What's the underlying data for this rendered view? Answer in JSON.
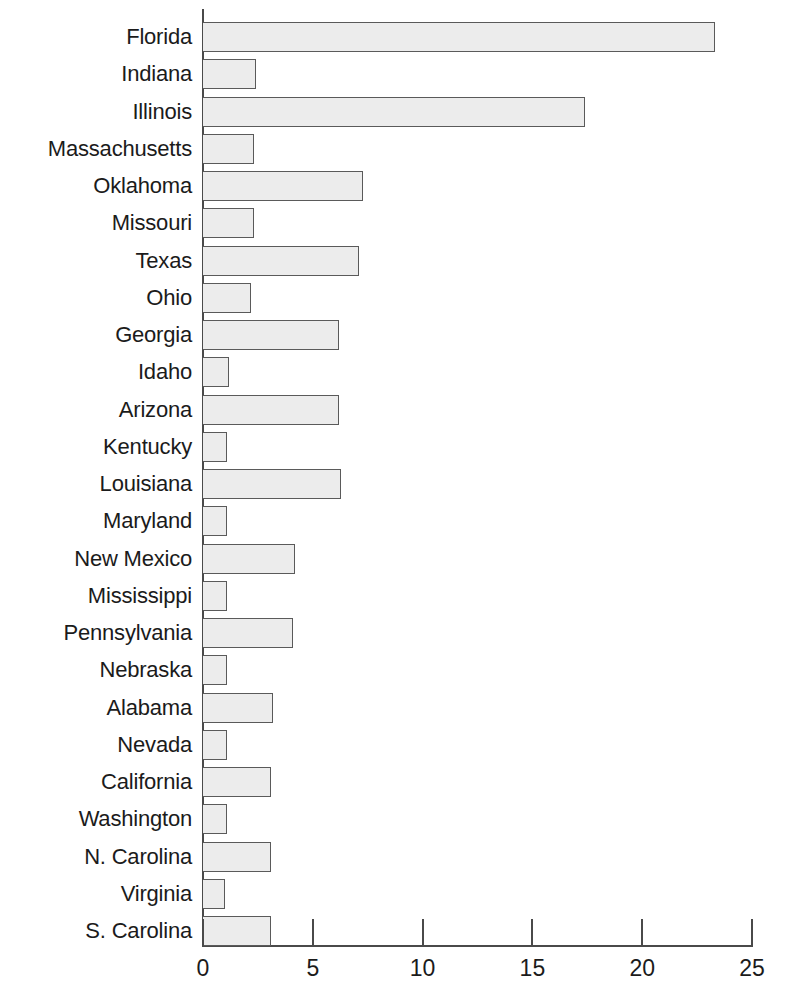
{
  "chart_data": {
    "type": "bar",
    "orientation": "horizontal",
    "title": "",
    "subtitle": "",
    "xlabel": "",
    "ylabel": "",
    "xlim": [
      0,
      25
    ],
    "grid": false,
    "legend": null,
    "xticks": [
      0,
      5,
      10,
      15,
      20,
      25
    ],
    "xtick_labels": [
      "0",
      "5",
      "10",
      "15",
      "20",
      "25"
    ],
    "categories": [
      "Florida",
      "Indiana",
      "Illinois",
      "Massachusetts",
      "Oklahoma",
      "Missouri",
      "Texas",
      "Ohio",
      "Georgia",
      "Idaho",
      "Arizona",
      "Kentucky",
      "Louisiana",
      "Maryland",
      "New Mexico",
      "Mississippi",
      "Pennsylvania",
      "Nebraska",
      "Alabama",
      "Nevada",
      "California",
      "Washington",
      "N. Carolina",
      "Virginia",
      "S. Carolina"
    ],
    "values": [
      23.3,
      2.4,
      17.4,
      2.3,
      7.3,
      2.3,
      7.1,
      2.2,
      6.2,
      1.2,
      6.2,
      1.1,
      6.3,
      1.1,
      4.2,
      1.1,
      4.1,
      1.1,
      3.2,
      1.1,
      3.1,
      1.1,
      3.1,
      1.0,
      3.1
    ],
    "bar_fill_color": "#ececec",
    "bar_edge_color": "#5a5a5a",
    "axis_color": "#4a4a4a"
  }
}
